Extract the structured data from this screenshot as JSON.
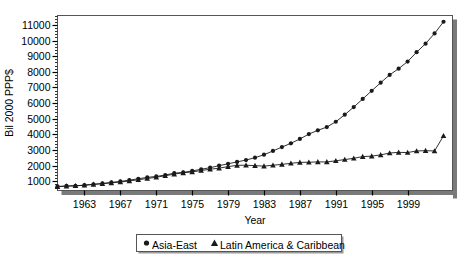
{
  "chart_data": {
    "type": "line",
    "title": "",
    "xlabel": "Year",
    "ylabel": "Bil 2000 PPP$",
    "xlim": [
      1960,
      2004
    ],
    "ylim": [
      400,
      11600
    ],
    "grid": false,
    "legend_position": "bottom",
    "ytick_labels": [
      "1000",
      "2000",
      "3000",
      "4000",
      "5000",
      "6000",
      "7000",
      "8000",
      "9000",
      "10000",
      "11000"
    ],
    "ytick_values": [
      1000,
      2000,
      3000,
      4000,
      5000,
      6000,
      7000,
      8000,
      9000,
      10000,
      11000
    ],
    "yminor_step": 200,
    "xtick_labels": [
      "1963",
      "1967",
      "1971",
      "1975",
      "1979",
      "1983",
      "1987",
      "1991",
      "1995",
      "1999"
    ],
    "xtick_values": [
      1963,
      1967,
      1971,
      1975,
      1979,
      1983,
      1987,
      1991,
      1995,
      1999
    ],
    "x": [
      1960,
      1961,
      1962,
      1963,
      1964,
      1965,
      1966,
      1967,
      1968,
      1969,
      1970,
      1971,
      1972,
      1973,
      1974,
      1975,
      1976,
      1977,
      1978,
      1979,
      1980,
      1981,
      1982,
      1983,
      1984,
      1985,
      1986,
      1987,
      1988,
      1989,
      1990,
      1991,
      1992,
      1993,
      1994,
      1995,
      1996,
      1997,
      1998,
      1999,
      2000,
      2001,
      2002,
      2003
    ],
    "series": [
      {
        "name": "Asia-East",
        "marker": "circle",
        "color": "#1a1a1a",
        "values": [
          660,
          690,
          700,
          740,
          800,
          850,
          920,
          980,
          1060,
          1150,
          1240,
          1300,
          1390,
          1510,
          1560,
          1650,
          1760,
          1860,
          1990,
          2110,
          2230,
          2350,
          2500,
          2690,
          2930,
          3180,
          3420,
          3700,
          4010,
          4250,
          4460,
          4800,
          5250,
          5740,
          6260,
          6780,
          7300,
          7800,
          8200,
          8650,
          9250,
          9800,
          10450,
          11200
        ]
      },
      {
        "name": "Latin America & Caribbean",
        "marker": "triangle",
        "color": "#1a1a1a",
        "values": [
          640,
          680,
          700,
          740,
          790,
          830,
          890,
          940,
          1010,
          1090,
          1170,
          1250,
          1340,
          1450,
          1530,
          1590,
          1680,
          1760,
          1830,
          1930,
          2010,
          2020,
          1990,
          1960,
          2020,
          2070,
          2140,
          2200,
          2210,
          2230,
          2230,
          2300,
          2380,
          2460,
          2570,
          2600,
          2680,
          2800,
          2840,
          2830,
          2930,
          2950,
          2930,
          3900
        ]
      }
    ]
  },
  "legend": {
    "items": [
      {
        "label": "Asia-East",
        "marker": "circle"
      },
      {
        "label": "Latin America & Caribbean",
        "marker": "triangle"
      }
    ]
  }
}
